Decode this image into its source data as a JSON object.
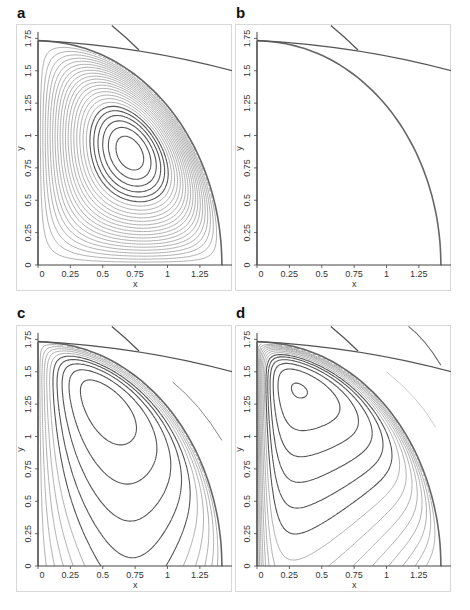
{
  "chart_data": [
    {
      "panel": "a",
      "type": "line",
      "subtype": "contour",
      "xlabel": "x",
      "ylabel": "y",
      "xticks": [
        "0",
        "0.25",
        "0.5",
        "0.75",
        "1",
        "1.25"
      ],
      "yticks": [
        "0",
        "0.25",
        "0.5",
        "0.75",
        "1",
        "1.25",
        "1.5",
        "1.75"
      ],
      "xlim": [
        0,
        1.5
      ],
      "ylim": [
        0,
        1.8
      ],
      "grid": false,
      "domain_boundary": {
        "shape": "quarter-ellipse",
        "a": 1.42,
        "b": 1.73
      },
      "description": "Closed streamlines forming a single vortex centered near (0.85, 1.0)",
      "vortex_center": [
        0.85,
        1.0
      ],
      "contour_count": 24
    },
    {
      "panel": "b",
      "type": "line",
      "subtype": "contour",
      "xlabel": "x",
      "ylabel": "y",
      "xticks": [
        "0",
        "0.25",
        "0.5",
        "0.75",
        "1",
        "1.25"
      ],
      "yticks": [
        "0",
        "0.25",
        "0.5",
        "0.75",
        "1",
        "1.25",
        "1.5",
        "1.75"
      ],
      "xlim": [
        0,
        1.5
      ],
      "ylim": [
        0,
        1.8
      ],
      "grid": false,
      "domain_boundary": {
        "shape": "quarter-ellipse",
        "a": 1.42,
        "b": 1.73
      },
      "description": "Closed streamlines with an elongated tilted vortex; innermost contour spans y 0.6 to 1.6",
      "vortex_center": [
        0.75,
        1.1
      ],
      "contour_count": 22
    },
    {
      "panel": "c",
      "type": "line",
      "subtype": "contour",
      "xlabel": "x",
      "ylabel": "y",
      "xticks": [
        "0",
        "0.25",
        "0.5",
        "0.75",
        "1",
        "1.25"
      ],
      "yticks": [
        "0",
        "0.25",
        "0.5",
        "0.75",
        "1",
        "1.25",
        "1.5",
        "1.75"
      ],
      "xlim": [
        0,
        1.5
      ],
      "ylim": [
        0,
        1.8
      ],
      "grid": false,
      "domain_boundary": {
        "shape": "quarter-ellipse",
        "a": 1.42,
        "b": 1.73
      },
      "description": "Open S-shaped streamlines from top-left wall sweeping to right wall; lowest turning points near y 0.65, 0.42, 0.25, 0.14",
      "contour_count": 14
    },
    {
      "panel": "d",
      "type": "line",
      "subtype": "contour",
      "xlabel": "x",
      "ylabel": "y",
      "xticks": [
        "0",
        "0.25",
        "0.5",
        "0.75",
        "1",
        "1.25"
      ],
      "yticks": [
        "0",
        "0.25",
        "0.5",
        "0.75",
        "1",
        "1.25",
        "1.5",
        "1.75"
      ],
      "xlim": [
        0,
        1.5
      ],
      "ylim": [
        0,
        1.8
      ],
      "grid": false,
      "domain_boundary": {
        "shape": "quarter-ellipse",
        "a": 1.42,
        "b": 1.73
      },
      "description": "Streamlines descending from left wall (y 1.5 down to 0.05) curving down to the bottom/right walls",
      "contour_count": 14
    }
  ],
  "panels": [
    {
      "label": "a",
      "xlabel": "x",
      "ylabel": "y"
    },
    {
      "label": "b",
      "xlabel": "x",
      "ylabel": "y"
    },
    {
      "label": "c",
      "xlabel": "x",
      "ylabel": "y"
    },
    {
      "label": "d",
      "xlabel": "x",
      "ylabel": "y"
    }
  ],
  "colors": {
    "contour_light": "#9a9a9a",
    "contour_dark": "#555555",
    "axis": "#444444",
    "frame": "#d8d8d8"
  }
}
